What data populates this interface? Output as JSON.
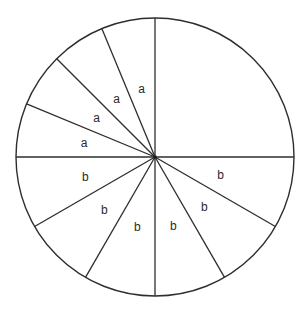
{
  "diagram": {
    "type": "partitioned-circle",
    "center": [
      155,
      157
    ],
    "radius": 139,
    "colors": {
      "background": "#ffffff",
      "stroke": "#2e2e2e",
      "text": "#2a2a2a"
    },
    "spoke_angles_deg": [
      0,
      90,
      112.5,
      135,
      157.5,
      180,
      210,
      240,
      270,
      300,
      330
    ],
    "sectors": [
      {
        "from": 0,
        "to": 90,
        "label": ""
      },
      {
        "from": 90,
        "to": 112.5,
        "label": "a",
        "pos": [
          141.7,
          89.3
        ]
      },
      {
        "from": 112.5,
        "to": 135,
        "label": "a",
        "pos": [
          116.7,
          99.3
        ]
      },
      {
        "from": 135,
        "to": 157.5,
        "label": "a",
        "pos": [
          96.7,
          117.7
        ]
      },
      {
        "from": 157.5,
        "to": 180,
        "label": "a",
        "pos": [
          84,
          143.3
        ]
      },
      {
        "from": 180,
        "to": 210,
        "label": "b",
        "pos": [
          85.3,
          176.7
        ]
      },
      {
        "from": 210,
        "to": 240,
        "label": "b",
        "pos": [
          104.3,
          210
        ]
      },
      {
        "from": 240,
        "to": 270,
        "label": "b",
        "pos": [
          137.3,
          226.7
        ]
      },
      {
        "from": 270,
        "to": 300,
        "label": "b",
        "pos": [
          173.3,
          226
        ]
      },
      {
        "from": 300,
        "to": 330,
        "label": "b",
        "pos": [
          204.3,
          207.3
        ]
      },
      {
        "from": 330,
        "to": 360,
        "label": "b",
        "pos": [
          220.7,
          175
        ]
      }
    ]
  }
}
